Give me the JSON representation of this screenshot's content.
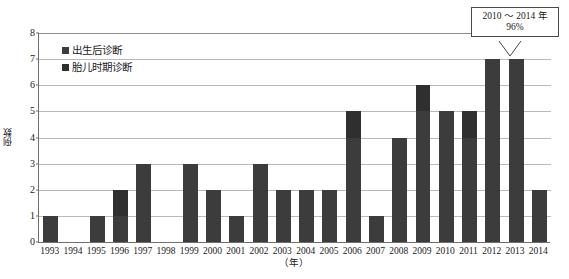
{
  "chart_data": {
    "type": "bar",
    "title": "",
    "xlabel": "（年）",
    "ylabel": "例数",
    "ylim": [
      0,
      8
    ],
    "ytick_values": [
      0,
      1,
      2,
      3,
      4,
      5,
      6,
      7,
      8
    ],
    "ytick_labels": [
      "0",
      "1",
      "2",
      "3",
      "4",
      "5",
      "6",
      "7",
      "8"
    ],
    "grid": true,
    "legend_position": "upper-left-inside",
    "categories": [
      "1993",
      "1994",
      "1995",
      "1996",
      "1997",
      "1998",
      "1999",
      "2000",
      "2001",
      "2002",
      "2003",
      "2004",
      "2005",
      "2006",
      "2007",
      "2008",
      "2009",
      "2010",
      "2011",
      "2012",
      "2013",
      "2014"
    ],
    "values": [
      1,
      0,
      1,
      2,
      3,
      0,
      3,
      2,
      1,
      3,
      2,
      2,
      2,
      5,
      1,
      4,
      6,
      5,
      5,
      7,
      7,
      2
    ],
    "series": [
      {
        "name": "出生后诊断",
        "color": "#3c3c3c",
        "values": [
          1,
          0,
          1,
          1,
          3,
          0,
          3,
          2,
          1,
          3,
          2,
          2,
          2,
          4,
          1,
          4,
          5,
          5,
          4,
          7,
          7,
          2
        ]
      },
      {
        "name": "胎儿时期诊断",
        "color": "#2f2f2f",
        "values": [
          0,
          0,
          0,
          1,
          0,
          0,
          0,
          0,
          0,
          0,
          0,
          0,
          0,
          1,
          0,
          0,
          1,
          0,
          1,
          0,
          0,
          0
        ]
      }
    ],
    "annotations": [
      {
        "name": "period-share-callout",
        "line1": "2010 ～ 2014 年",
        "line2": "96%",
        "points_at": "2013"
      }
    ]
  },
  "legend": {
    "items": [
      {
        "label": "出生后诊断",
        "marker": "■"
      },
      {
        "label": "胎儿时期诊断",
        "marker": "■"
      }
    ]
  },
  "colors": {
    "bar_postnatal": "#3c3c3c",
    "bar_prenatal": "#2f2f2f",
    "gridline": "#b9b9b9",
    "axis": "#6e6e6e",
    "callout_border": "#4a4a4a",
    "text": "#1a1a1a",
    "background": "#ffffff"
  }
}
